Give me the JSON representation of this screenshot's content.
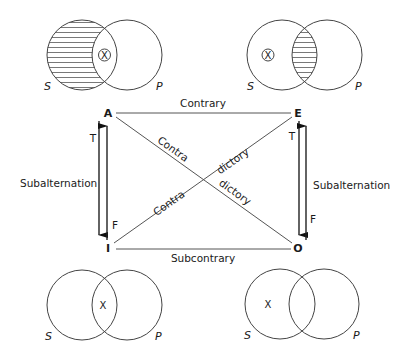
{
  "square": {
    "corners": {
      "A": "A",
      "E": "E",
      "I": "I",
      "O": "O"
    },
    "relations": {
      "contrary": "Contrary",
      "subcontrary": "Subcontrary",
      "contradictory_a_part1": "Contra",
      "contradictory_a_part2": "dictory",
      "contradictory_b_part1": "Contra",
      "contradictory_b_part2": "dictory",
      "subalternation_left": "Subalternation",
      "subalternation_right": "Subalternation"
    },
    "truth_labels": {
      "left_T": "T",
      "left_F": "F",
      "right_T": "T",
      "right_F": "F"
    }
  },
  "venn_diagrams": [
    {
      "position": "top-left",
      "proposition": "A",
      "subject_label": "S",
      "predicate_label": "P",
      "shaded_region": "S-only",
      "x_mark": "X",
      "x_mark_circled": true,
      "x_region": "S∩P"
    },
    {
      "position": "top-right",
      "proposition": "E",
      "subject_label": "S",
      "predicate_label": "P",
      "shaded_region": "S∩P",
      "x_mark": "X",
      "x_mark_circled": true,
      "x_region": "S-only"
    },
    {
      "position": "bottom-left",
      "proposition": "I",
      "subject_label": "S",
      "predicate_label": "P",
      "shaded_region": "none",
      "x_mark": "X",
      "x_mark_circled": false,
      "x_region": "S∩P"
    },
    {
      "position": "bottom-right",
      "proposition": "O",
      "subject_label": "S",
      "predicate_label": "P",
      "shaded_region": "none",
      "x_mark": "X",
      "x_mark_circled": false,
      "x_region": "S-only"
    }
  ]
}
